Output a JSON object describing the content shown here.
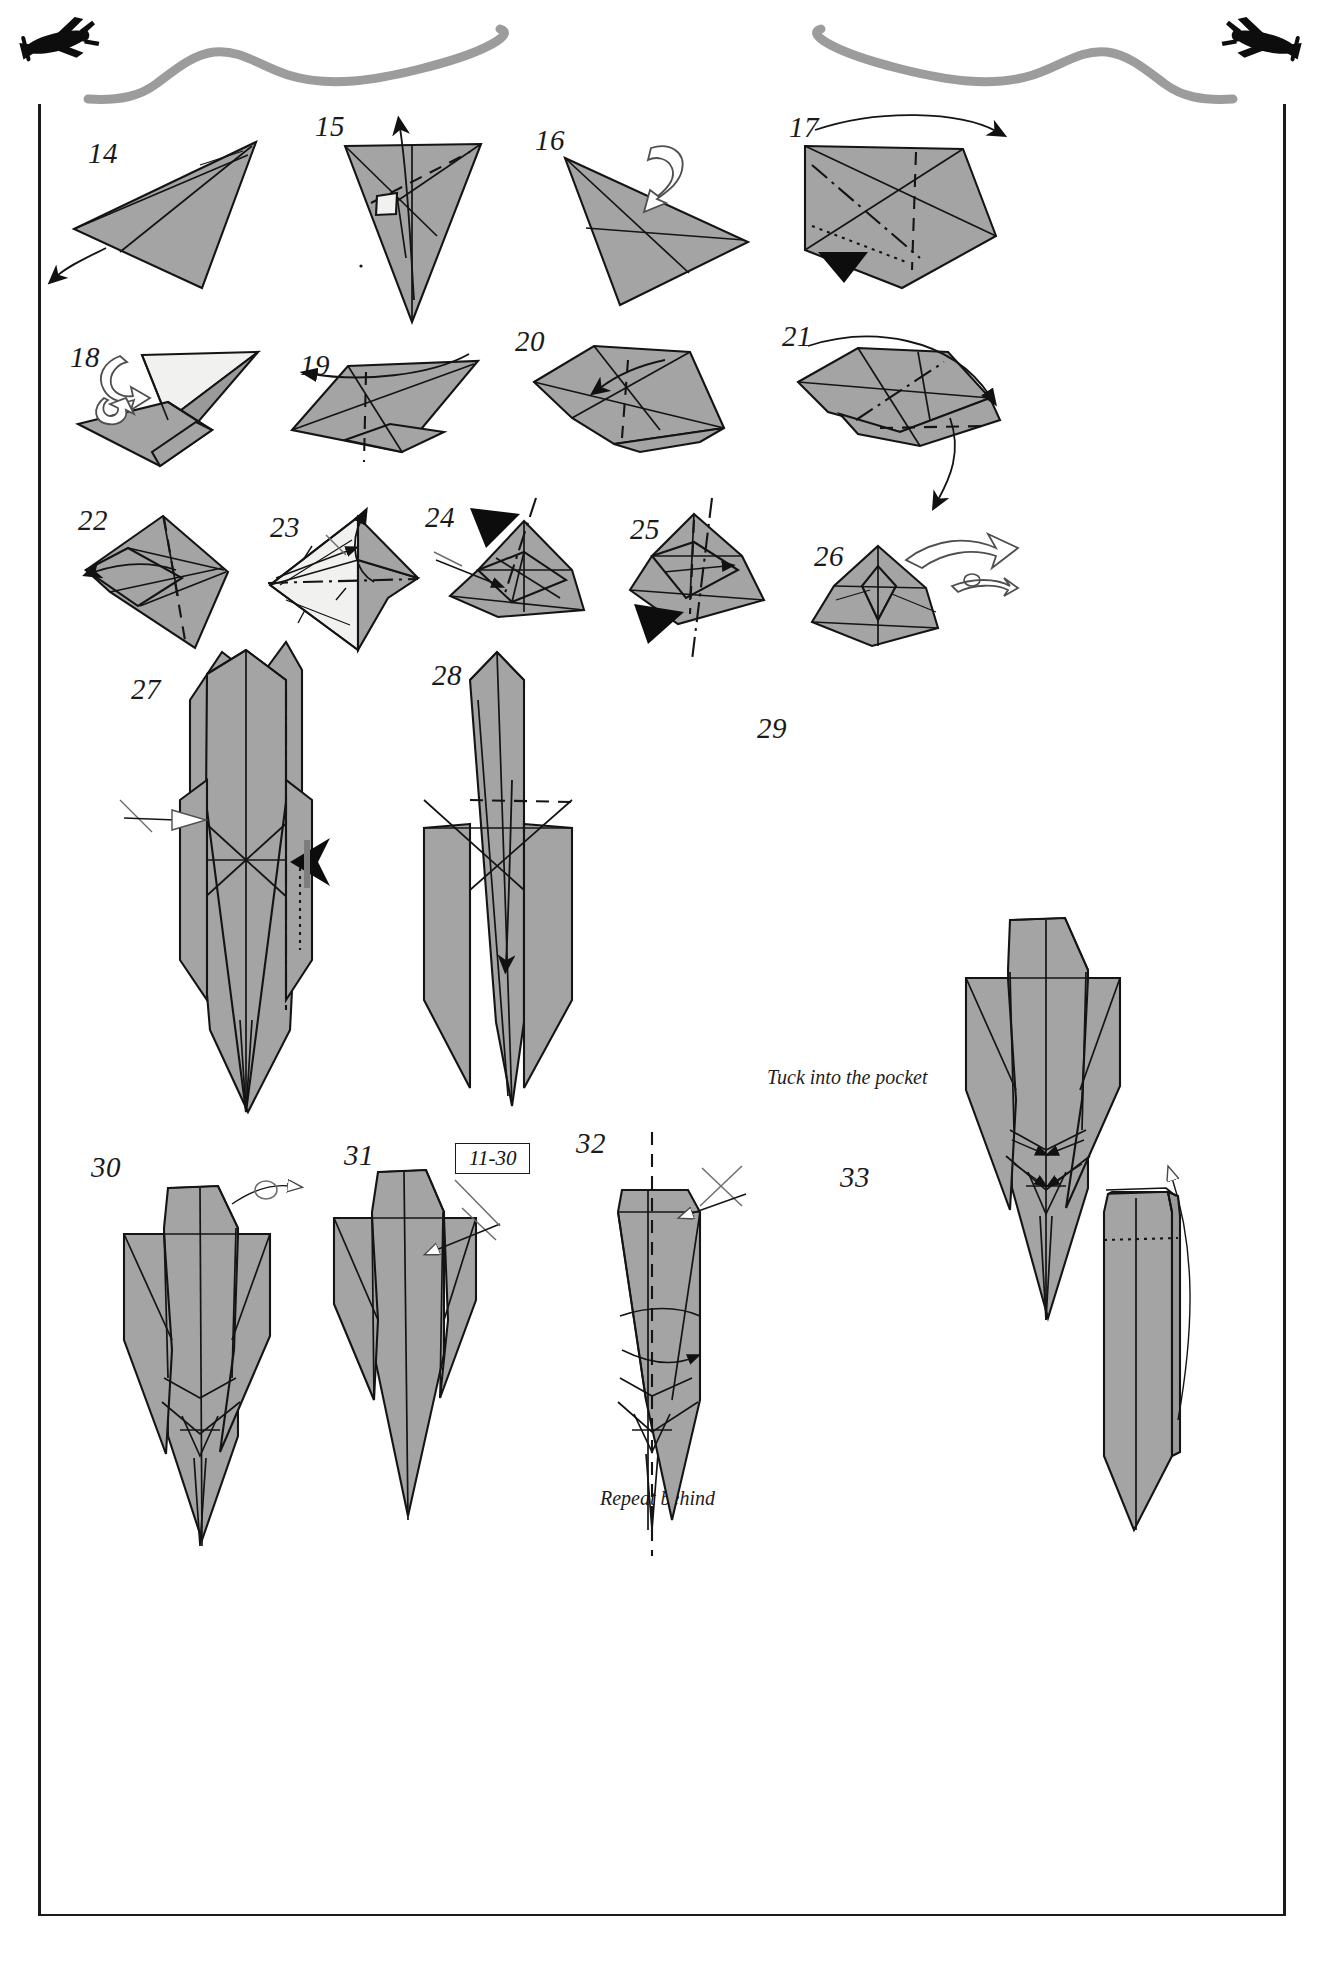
{
  "page": {
    "kind": "origami-diagram-page",
    "background_color": "#ffffff",
    "ink_color": "#1a1a1a",
    "paper_front_color": "#a3a3a3",
    "paper_back_color": "#f2f2f0",
    "contrail_color": "#9a9a9a",
    "frame": {
      "left_rule": true,
      "right_rule": true,
      "bottom_rule": true
    }
  },
  "decor": {
    "planes": [
      {
        "name": "airplane-left",
        "label": "plane-silhouette-left"
      },
      {
        "name": "airplane-right",
        "label": "plane-silhouette-right"
      }
    ],
    "contrails": [
      {
        "name": "contrail-left"
      },
      {
        "name": "contrail-right"
      }
    ]
  },
  "legend": {
    "valley_fold": "dashed line",
    "mountain_fold": "dash-dot line",
    "hidden_edge": "dotted line",
    "push_arrow": "solid black arrowhead",
    "turn_over_arrow": "white outline looped arrow",
    "repeat_symbol": "crossed line with arrow"
  },
  "steps": [
    {
      "n": "14",
      "num_x": 88,
      "num_y": 139,
      "symbols": [
        "pull-arrow-down-left"
      ]
    },
    {
      "n": "15",
      "num_x": 315,
      "num_y": 112,
      "symbols": [
        "valley-fold",
        "rotate-arrow-up",
        "white-flap"
      ]
    },
    {
      "n": "16",
      "num_x": 535,
      "num_y": 126,
      "symbols": [
        "turn-over-arrow"
      ]
    },
    {
      "n": "17",
      "num_x": 789,
      "num_y": 113,
      "symbols": [
        "mountain-fold",
        "valley-fold",
        "hidden-edge",
        "push-arrow",
        "fold-over-arrow"
      ]
    },
    {
      "n": "18",
      "num_x": 70,
      "num_y": 343,
      "symbols": [
        "turn-over-arrow",
        "white-back-surface"
      ]
    },
    {
      "n": "19",
      "num_x": 300,
      "num_y": 351,
      "symbols": [
        "valley-fold",
        "incoming-arrow"
      ]
    },
    {
      "n": "20",
      "num_x": 515,
      "num_y": 327,
      "symbols": [
        "valley-fold",
        "fold-arrow"
      ]
    },
    {
      "n": "21",
      "num_x": 782,
      "num_y": 322,
      "symbols": [
        "mountain-fold",
        "valley-fold",
        "swing-arrow-down"
      ]
    },
    {
      "n": "22",
      "num_x": 78,
      "num_y": 506,
      "symbols": [
        "valley-fold",
        "pull-arrow-left"
      ]
    },
    {
      "n": "23",
      "num_x": 270,
      "num_y": 513,
      "symbols": [
        "mountain-fold",
        "repeat-symbol",
        "arrow-up",
        "arrow-right"
      ]
    },
    {
      "n": "24",
      "num_x": 425,
      "num_y": 503,
      "symbols": [
        "push-arrow",
        "mountain-axis",
        "repeat-symbol"
      ]
    },
    {
      "n": "25",
      "num_x": 630,
      "num_y": 515,
      "symbols": [
        "push-arrow",
        "mountain-axis",
        "arrow-right"
      ]
    },
    {
      "n": "26",
      "num_x": 814,
      "num_y": 542,
      "symbols": [
        "turn-over-arrow",
        "rotate-arrow"
      ]
    },
    {
      "n": "27",
      "num_x": 131,
      "num_y": 675,
      "symbols": [
        "mountain-fold",
        "white-arrow-in",
        "push-arrow"
      ]
    },
    {
      "n": "28",
      "num_x": 432,
      "num_y": 661,
      "symbols": [
        "valley-fold",
        "pull-arrow-down"
      ]
    },
    {
      "n": "29",
      "num_x": 757,
      "num_y": 714,
      "symbols": [
        "tuck-arrows"
      ],
      "caption": "Tuck into the pocket"
    },
    {
      "n": "30",
      "num_x": 91,
      "num_y": 1153,
      "symbols": [
        "rotate-arrow"
      ]
    },
    {
      "n": "31",
      "num_x": 344,
      "num_y": 1141,
      "symbols": [
        "repeat-symbol"
      ],
      "badge": "11-30"
    },
    {
      "n": "32",
      "num_x": 576,
      "num_y": 1129,
      "symbols": [
        "valley-fold",
        "repeat-symbol",
        "fold-arrow"
      ],
      "caption": "Repeat behind"
    },
    {
      "n": "33",
      "num_x": 840,
      "num_y": 1163,
      "symbols": [
        "hidden-edge",
        "open-arrow-up"
      ]
    }
  ],
  "captions": [
    {
      "name": "tuck-into-pocket-caption",
      "text": "Tuck into the pocket",
      "x": 767,
      "y": 1066
    },
    {
      "name": "repeat-behind-caption",
      "text": "Repeat behind",
      "x": 600,
      "y": 1487
    }
  ],
  "badges": [
    {
      "name": "repeat-steps-badge",
      "text": "11-30",
      "x": 455,
      "y": 1143
    }
  ]
}
